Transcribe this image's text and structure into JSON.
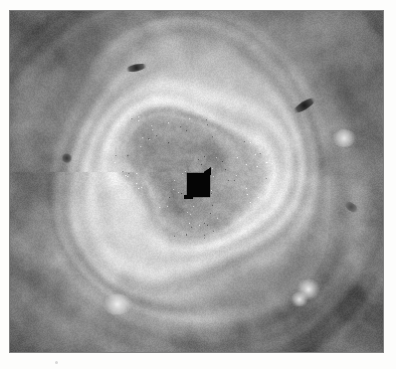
{
  "document": {
    "title": "Polar vortex cloud structure",
    "kind": "grayscale-photograph",
    "alt_text": "Grayscale polar projection of a giant-planet atmosphere showing concentric cloud bands spiralling around a central pole, with a black square data gap at the pole."
  },
  "plate": {
    "left": 9,
    "top": 10,
    "width": 375,
    "height": 343,
    "border_color": "#7e7e7e",
    "page_background": "#fdfdfc"
  },
  "data_gap": {
    "label": "central data gap",
    "color": "#050505",
    "x": 177,
    "y": 162,
    "width": 23,
    "height": 24
  },
  "artifacts": {
    "margin_speck": {
      "label": "scan speck",
      "x": 55,
      "y": 361,
      "color": "#d8d8d8"
    }
  },
  "chart_data": {
    "type": "heatmap",
    "title": "Polar vortex cloud structure",
    "colormap": "grayscale",
    "value_range": [
      0,
      255
    ],
    "center": [
      188,
      172
    ],
    "rings": [
      {
        "name": "inner-core",
        "radius_outer": 62,
        "mean_gray": 146,
        "note": "mottled mid-grey pole interior with bright specks"
      },
      {
        "name": "bright-annulus",
        "radius_inner": 62,
        "radius_outer": 104,
        "mean_gray": 214,
        "note": "brightest concentric cloud collar"
      },
      {
        "name": "mid-band",
        "radius_inner": 104,
        "radius_outer": 140,
        "mean_gray": 168,
        "note": "intermediate banded ring"
      },
      {
        "name": "outer-dark-band",
        "radius_inner": 140,
        "radius_outer": 200,
        "mean_gray": 118,
        "note": "dark spiral streaks toward the frame edges"
      }
    ],
    "dark_ovals": [
      {
        "name": "oval-ne",
        "cx": 305,
        "cy": 105,
        "rx": 13,
        "ry": 4,
        "angle_deg": -32,
        "gray": 22
      },
      {
        "name": "oval-n",
        "cx": 136,
        "cy": 67,
        "rx": 11,
        "ry": 3.5,
        "angle_deg": -12,
        "gray": 32
      },
      {
        "name": "oval-w",
        "cx": 66,
        "cy": 158,
        "rx": 6,
        "ry": 5,
        "angle_deg": 20,
        "gray": 52
      },
      {
        "name": "oval-e",
        "cx": 352,
        "cy": 207,
        "rx": 8,
        "ry": 4,
        "angle_deg": 35,
        "gray": 74
      }
    ],
    "bright_plumes": [
      {
        "name": "plume-sw",
        "cx": 117,
        "cy": 305,
        "rx": 10,
        "ry": 7,
        "gray": 245
      },
      {
        "name": "plume-se",
        "cx": 309,
        "cy": 290,
        "rx": 8,
        "ry": 7,
        "gray": 243
      },
      {
        "name": "plume-e",
        "cx": 345,
        "cy": 138,
        "rx": 8,
        "ry": 6,
        "gray": 238
      },
      {
        "name": "plume-s",
        "cx": 300,
        "cy": 300,
        "rx": 6,
        "ry": 5,
        "gray": 236
      }
    ],
    "xlabel": "",
    "ylabel": "",
    "grid": false,
    "legend": "none"
  }
}
